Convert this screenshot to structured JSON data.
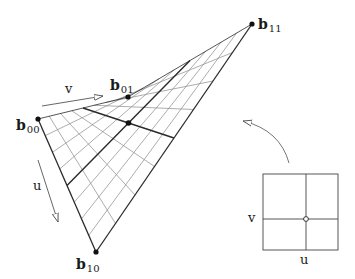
{
  "diagram": {
    "type": "bilinear-patch",
    "colors": {
      "line": "#2a2a2a",
      "grid": "#8a8a8a",
      "background": "#ffffff"
    },
    "subdivisions": 8,
    "control_points": {
      "b00": {
        "label": "b",
        "sub": "00",
        "x": 38,
        "y": 119
      },
      "b01": {
        "label": "b",
        "sub": "01",
        "x": 128,
        "y": 97
      },
      "b10": {
        "label": "b",
        "sub": "10",
        "x": 96,
        "y": 252
      },
      "b11": {
        "label": "b",
        "sub": "11",
        "x": 252,
        "y": 24
      }
    },
    "center_point": {
      "u": 0.5,
      "v": 0.5
    },
    "direction_labels": {
      "v": "v",
      "u": "u"
    },
    "parameter_square": {
      "x": 263,
      "y": 174,
      "width": 75,
      "height": 76,
      "divider_x": 306,
      "divider_y": 219,
      "v_label": "v",
      "u_label": "u"
    }
  }
}
